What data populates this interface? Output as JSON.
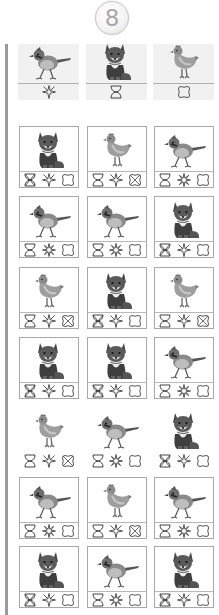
{
  "page": {
    "number_badge": "8"
  },
  "colors": {
    "line": "#a8a8a8",
    "key_bg": "#f1f1f1",
    "left_bar": "#9a9a9a",
    "symbol_stroke": "#444444"
  },
  "key": [
    {
      "animal": "bird",
      "symbol": "star"
    },
    {
      "animal": "fox",
      "symbol": "hourglass"
    },
    {
      "animal": "hen",
      "symbol": "flower"
    }
  ],
  "grid": {
    "columns": 3,
    "rows": [
      [
        {
          "animal": "fox",
          "symbols": [
            "hourglass-crossed",
            "star",
            "flower"
          ],
          "bordered": true
        },
        {
          "animal": "hen",
          "symbols": [
            "hourglass",
            "star",
            "flower-crossed"
          ],
          "bordered": true
        },
        {
          "animal": "bird",
          "symbols": [
            "hourglass",
            "star-burst",
            "flower"
          ],
          "bordered": true
        }
      ],
      [
        {
          "animal": "bird",
          "symbols": [
            "hourglass",
            "star-burst",
            "flower"
          ],
          "bordered": true
        },
        {
          "animal": "bird",
          "symbols": [
            "hourglass",
            "star-burst",
            "flower"
          ],
          "bordered": true
        },
        {
          "animal": "fox",
          "symbols": [
            "hourglass-crossed",
            "star",
            "flower"
          ],
          "bordered": true
        }
      ],
      [
        {
          "animal": "hen",
          "symbols": [
            "hourglass",
            "star",
            "flower-crossed"
          ],
          "bordered": true
        },
        {
          "animal": "fox",
          "symbols": [
            "hourglass-crossed",
            "star",
            "flower"
          ],
          "bordered": true
        },
        {
          "animal": "hen",
          "symbols": [
            "hourglass",
            "star",
            "flower-crossed"
          ],
          "bordered": true
        }
      ],
      [
        {
          "animal": "fox",
          "symbols": [
            "hourglass-crossed",
            "star",
            "flower"
          ],
          "bordered": true
        },
        {
          "animal": "fox",
          "symbols": [
            "hourglass-crossed",
            "star",
            "flower"
          ],
          "bordered": true
        },
        {
          "animal": "bird",
          "symbols": [
            "hourglass",
            "star-burst",
            "flower"
          ],
          "bordered": true
        }
      ],
      [
        {
          "animal": "hen",
          "symbols": [
            "hourglass",
            "star",
            "flower-crossed"
          ],
          "bordered": false
        },
        {
          "animal": "bird",
          "symbols": [
            "hourglass",
            "star-burst",
            "flower"
          ],
          "bordered": false
        },
        {
          "animal": "fox",
          "symbols": [
            "hourglass-crossed",
            "star",
            "flower"
          ],
          "bordered": false
        }
      ],
      [
        {
          "animal": "bird",
          "symbols": [
            "hourglass",
            "star-burst",
            "flower"
          ],
          "bordered": true
        },
        {
          "animal": "hen",
          "symbols": [
            "hourglass",
            "star",
            "flower-crossed"
          ],
          "bordered": true
        },
        {
          "animal": "bird",
          "symbols": [
            "hourglass",
            "star-burst",
            "flower"
          ],
          "bordered": true
        }
      ],
      [
        {
          "animal": "fox",
          "symbols": [
            "hourglass-crossed",
            "star",
            "flower"
          ],
          "bordered": true
        },
        {
          "animal": "bird",
          "symbols": [
            "hourglass",
            "star-burst",
            "flower"
          ],
          "bordered": true
        },
        {
          "animal": "fox",
          "symbols": [
            "hourglass-crossed",
            "star",
            "flower"
          ],
          "bordered": true
        }
      ]
    ]
  }
}
